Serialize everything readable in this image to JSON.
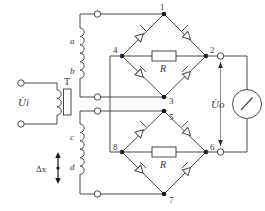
{
  "diagram": {
    "stroke_color": "#4a4a4a",
    "label_color": "#3a3a3a",
    "background": "#ffffff"
  },
  "source": {
    "input_label": "U̇i",
    "transformer_label": "T",
    "displacement_label": "Δx"
  },
  "windings": {
    "a": "a",
    "b": "b",
    "c": "c",
    "d": "d"
  },
  "bridge_top": {
    "nodes": [
      "1",
      "2",
      "3",
      "4"
    ],
    "resistor_label": "R"
  },
  "bridge_bottom": {
    "nodes": [
      "5",
      "6",
      "7",
      "8"
    ],
    "resistor_label": "R"
  },
  "output": {
    "label": "U̇o"
  },
  "meter": {
    "name": "indicating-meter"
  }
}
